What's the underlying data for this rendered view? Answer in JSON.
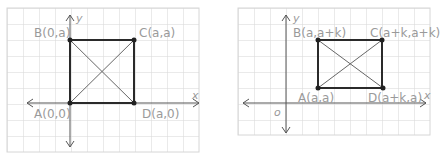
{
  "diagrams": [
    {
      "name": "square",
      "axes": {
        "x": "x",
        "y": "y"
      },
      "points": {
        "A": "A(0,0)",
        "B": "B(0,a)",
        "C": "C(a,a)",
        "D": "D(a,0)"
      }
    },
    {
      "name": "square-translated",
      "axes": {
        "x": "x",
        "y": "y",
        "origin": "o"
      },
      "points": {
        "A": "A(a,a)",
        "B": "B(a,a+k)",
        "C": "C(a+k,a+k)",
        "D": "D(a+k,a)"
      }
    }
  ],
  "colors": {
    "grid": "#d6d6d6",
    "axis": "#555555",
    "shape": "#2a2a2a",
    "label": "#9a9a9a"
  }
}
